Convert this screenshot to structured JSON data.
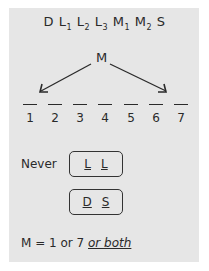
{
  "sequence": [
    {
      "base": "D",
      "sub": ""
    },
    {
      "base": "L",
      "sub": "1"
    },
    {
      "base": "L",
      "sub": "2"
    },
    {
      "base": "L",
      "sub": "3"
    },
    {
      "base": "M",
      "sub": "1"
    },
    {
      "base": "M",
      "sub": "2"
    },
    {
      "base": "S",
      "sub": ""
    }
  ],
  "arrow_source": "M",
  "positions": [
    "1",
    "2",
    "3",
    "4",
    "5",
    "6",
    "7"
  ],
  "rules": {
    "never_label": "Never",
    "never_pair_1": [
      "L",
      "L"
    ],
    "never_pair_2": [
      "D",
      "S"
    ]
  },
  "note": {
    "prefix": "M = 1 or 7 ",
    "emphasis": "or both"
  },
  "colors": {
    "panel": "#e6e6e6",
    "ink": "#2a2a2a"
  }
}
